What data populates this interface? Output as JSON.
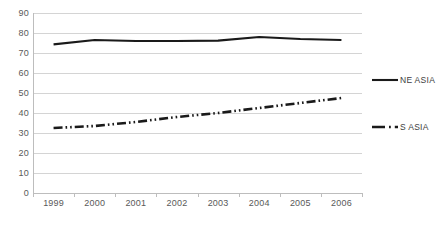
{
  "chart_data": {
    "type": "line",
    "title": "",
    "xlabel": "",
    "ylabel": "",
    "categories": [
      "1999",
      "2000",
      "2001",
      "2002",
      "2003",
      "2004",
      "2005",
      "2006"
    ],
    "series": [
      {
        "name": "NE ASIA",
        "style": "solid",
        "color": "#1a1a1a",
        "values": [
          74.3,
          76.5,
          76.0,
          76.0,
          76.2,
          78.0,
          77.0,
          76.5
        ]
      },
      {
        "name": "S ASIA",
        "style": "dash-dot",
        "color": "#1a1a1a",
        "values": [
          32.5,
          33.5,
          35.5,
          38.0,
          40.0,
          42.5,
          45.0,
          47.5
        ]
      }
    ],
    "ylim": [
      0,
      90
    ],
    "ytick_step": 10,
    "yticks": [
      "90",
      "80",
      "70",
      "60",
      "50",
      "40",
      "30",
      "20",
      "10",
      "0"
    ],
    "grid": "horizontal",
    "legend_position": "right",
    "legend": [
      {
        "label": "NE ASIA",
        "style": "solid"
      },
      {
        "label": "S ASIA",
        "style": "dash-dot"
      }
    ],
    "colors": {
      "gridline": "#d4d4d4",
      "axis": "#bdbdbd",
      "tick_text": "#595959",
      "legend_text": "#3d3d3d",
      "plot_background": "#ffffff"
    }
  }
}
